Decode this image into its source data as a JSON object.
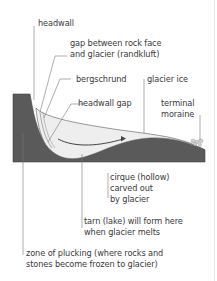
{
  "diagram": {
    "colors": {
      "rock": "#5a5a5a",
      "ice": "#eeeeee",
      "lines": "#555555",
      "text": "#3a3a3a"
    },
    "labels": {
      "headwall": "headwall",
      "randkluft_1": "gap between rock face",
      "randkluft_2": "and glacier (randkluft)",
      "bergschrund": "bergschrund",
      "glacier_ice": "glacier ice",
      "headwall_gap": "headwall gap",
      "terminal_moraine_1": "terminal",
      "terminal_moraine_2": "moraine",
      "cirque_1": "cirque (hollow)",
      "cirque_2": "carved out",
      "cirque_3": "by glacier",
      "tarn_1": "tarn (lake) will form here",
      "tarn_2": "when glacier melts",
      "plucking_1": "zone of plucking (where rocks and",
      "plucking_2": "stones become frozen to glacier)"
    }
  }
}
